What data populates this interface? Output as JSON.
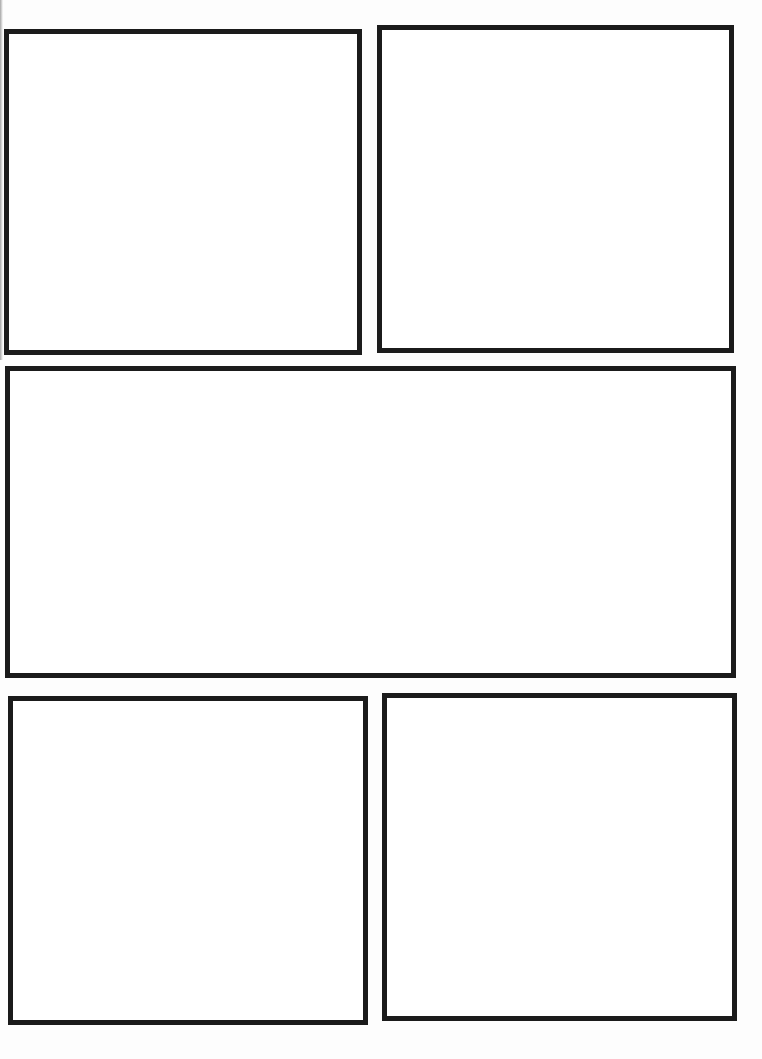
{
  "page": {
    "type": "comic-panel-template",
    "background_color": "#ffffff",
    "border_color": "#1b1b1b",
    "panel_count": 5
  },
  "panels": [
    {
      "id": "panel-1",
      "position": "top-left",
      "x": 4,
      "y": 29,
      "w": 358,
      "h": 326,
      "content": ""
    },
    {
      "id": "panel-2",
      "position": "top-right",
      "x": 377,
      "y": 25,
      "w": 357,
      "h": 328,
      "content": ""
    },
    {
      "id": "panel-3",
      "position": "middle-wide",
      "x": 5,
      "y": 366,
      "w": 731,
      "h": 312,
      "content": ""
    },
    {
      "id": "panel-4",
      "position": "bottom-left",
      "x": 8,
      "y": 696,
      "w": 360,
      "h": 329,
      "content": ""
    },
    {
      "id": "panel-5",
      "position": "bottom-right",
      "x": 382,
      "y": 693,
      "w": 355,
      "h": 328,
      "content": ""
    }
  ]
}
